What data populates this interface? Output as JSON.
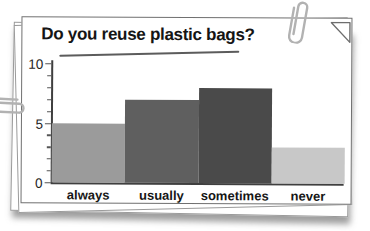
{
  "card": {
    "stack_layers": 3,
    "border_color": "#707070",
    "background": "#ffffff"
  },
  "decorations": {
    "paperclip_top_right": "paperclip-icon",
    "paperclip_left": "paperclip-icon",
    "folded_corner": "dog-ear-corner",
    "paperclip_color": "#b2b2b2"
  },
  "chart_data": {
    "type": "bar",
    "title": "Do you reuse plastic bags?",
    "xlabel": "",
    "ylabel": "",
    "categories": [
      "always",
      "usually",
      "sometimes",
      "never"
    ],
    "values": [
      5,
      7,
      8,
      3
    ],
    "bar_colors": [
      "#9b9b9b",
      "#5f5f5f",
      "#4a4a4a",
      "#c8c8c8"
    ],
    "ylim": [
      0,
      10
    ],
    "ytick_labels": [
      "0",
      "5",
      "10"
    ],
    "yticks_labeled": [
      0,
      5,
      10
    ],
    "minor_tick_step": 1,
    "grid": false,
    "legend": false,
    "axis_color": "#3f3f3f"
  }
}
